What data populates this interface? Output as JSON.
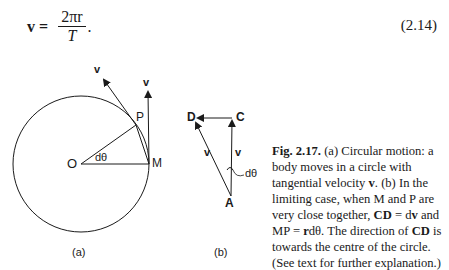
{
  "equation": {
    "lhs": "v =",
    "numerator": "2πr",
    "denominator": "T",
    "trailing": ".",
    "number": "(2.14)"
  },
  "figure_a": {
    "label": "(a)",
    "points": {
      "O": "O",
      "P": "P",
      "M": "M"
    },
    "angle_label": "dθ",
    "vector_labels": [
      "v",
      "v"
    ]
  },
  "figure_b": {
    "label": "(b)",
    "points": {
      "D": "D",
      "C": "C",
      "A": "A"
    },
    "angle_label": "dθ",
    "vector_labels": [
      "v",
      "v"
    ]
  },
  "caption": {
    "fig_label": "Fig. 2.17.",
    "text_1": " (a) Circular motion: a body moves in a circle with tangential velocity ",
    "bold_v": "v",
    "text_2": ". (b) In the limiting case, when M and P are very close together, ",
    "bold_cd": "CD",
    "text_3": " = d",
    "bold_v2": "v",
    "text_4": " and MP = ",
    "bold_r": "r",
    "text_5": "dθ. The direction of ",
    "bold_cd2": "CD",
    "text_6": " is towards the centre of the circle. (See text for further explanation.)"
  }
}
